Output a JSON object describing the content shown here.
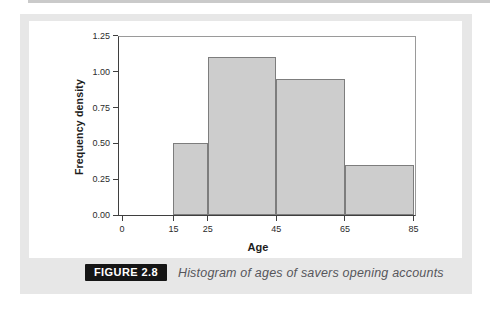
{
  "figure": {
    "label": "FIGURE 2.8",
    "caption": "Histogram of ages of savers opening accounts"
  },
  "chart_data": {
    "type": "bar",
    "subtype": "histogram",
    "title": "",
    "xlabel": "Age",
    "ylabel": "Frequency density",
    "xlim": [
      0,
      85
    ],
    "ylim": [
      0,
      1.25
    ],
    "grid": false,
    "x_ticks": [
      {
        "v": 0,
        "label": "0"
      },
      {
        "v": 15,
        "label": "15"
      },
      {
        "v": 25,
        "label": "25"
      },
      {
        "v": 45,
        "label": "45"
      },
      {
        "v": 65,
        "label": "65"
      },
      {
        "v": 85,
        "label": "85"
      }
    ],
    "y_ticks": [
      {
        "v": 0.0,
        "label": "0.00"
      },
      {
        "v": 0.25,
        "label": "0.25"
      },
      {
        "v": 0.5,
        "label": "0.50"
      },
      {
        "v": 0.75,
        "label": "0.75"
      },
      {
        "v": 1.0,
        "label": "1.00"
      },
      {
        "v": 1.25,
        "label": "1.25"
      }
    ],
    "bins": [
      {
        "from": 15,
        "to": 25,
        "frequency_density": 0.5
      },
      {
        "from": 25,
        "to": 45,
        "frequency_density": 1.1
      },
      {
        "from": 45,
        "to": 65,
        "frequency_density": 0.95
      },
      {
        "from": 65,
        "to": 85,
        "frequency_density": 0.35
      }
    ],
    "colors": {
      "bar_fill": "#cdcdcd",
      "bar_border": "#7d7d7d",
      "axis": "#3f3f3f",
      "frame": "#9a9a9a"
    }
  },
  "colors": {
    "page_bg": "#ffffff",
    "panel_bg": "#e7e7e7",
    "chart_bg": "#ffffff",
    "badge_bg": "#151515",
    "badge_text": "#ffffff",
    "caption_text": "#56565b"
  }
}
